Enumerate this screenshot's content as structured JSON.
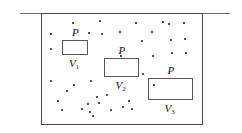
{
  "figure": {
    "name": "gas-pressure-volume-diagram",
    "background_color": "#ffffff",
    "line_color": "#4a4a4a",
    "dot_color": "#1a1a1a",
    "width": 242,
    "height": 133
  },
  "top_rule": {
    "label": "surface-line",
    "x": 20,
    "y": 13,
    "width": 210,
    "color": "#6d6d6d"
  },
  "container": {
    "label": "gas-container",
    "x": 41,
    "y": 13,
    "width": 162,
    "height": 112,
    "color": "#4a4a4a"
  },
  "volume_boxes": [
    {
      "id": "v1",
      "pressure_label": "P",
      "volume_label": "V",
      "volume_subscript": "1",
      "x": 62,
      "y": 40,
      "width": 26,
      "height": 15
    },
    {
      "id": "v2",
      "pressure_label": "P",
      "volume_label": "V",
      "volume_subscript": "2",
      "x": 104,
      "y": 58,
      "width": 35,
      "height": 19
    },
    {
      "id": "v3",
      "pressure_label": "P",
      "volume_label": "V",
      "volume_subscript": "3",
      "x": 148,
      "y": 78,
      "width": 45,
      "height": 22
    }
  ],
  "molecules": [
    {
      "x": 50,
      "y": 33
    },
    {
      "x": 50,
      "y": 48
    },
    {
      "x": 50,
      "y": 80
    },
    {
      "x": 57,
      "y": 100
    },
    {
      "x": 61,
      "y": 109
    },
    {
      "x": 66,
      "y": 90
    },
    {
      "x": 72,
      "y": 22
    },
    {
      "x": 73,
      "y": 84
    },
    {
      "x": 81,
      "y": 108
    },
    {
      "x": 87,
      "y": 103
    },
    {
      "x": 88,
      "y": 32
    },
    {
      "x": 89,
      "y": 111
    },
    {
      "x": 90,
      "y": 80
    },
    {
      "x": 92,
      "y": 115
    },
    {
      "x": 96,
      "y": 96
    },
    {
      "x": 98,
      "y": 102
    },
    {
      "x": 99,
      "y": 20
    },
    {
      "x": 101,
      "y": 33
    },
    {
      "x": 106,
      "y": 94
    },
    {
      "x": 110,
      "y": 109
    },
    {
      "x": 119,
      "y": 31
    },
    {
      "x": 120,
      "y": 55
    },
    {
      "x": 122,
      "y": 106
    },
    {
      "x": 128,
      "y": 100
    },
    {
      "x": 131,
      "y": 108
    },
    {
      "x": 135,
      "y": 22
    },
    {
      "x": 141,
      "y": 40
    },
    {
      "x": 142,
      "y": 73
    },
    {
      "x": 151,
      "y": 31
    },
    {
      "x": 152,
      "y": 55
    },
    {
      "x": 153,
      "y": 84
    },
    {
      "x": 162,
      "y": 21
    },
    {
      "x": 168,
      "y": 23
    },
    {
      "x": 170,
      "y": 39
    },
    {
      "x": 171,
      "y": 52
    },
    {
      "x": 183,
      "y": 22
    },
    {
      "x": 184,
      "y": 38
    },
    {
      "x": 185,
      "y": 52
    }
  ]
}
